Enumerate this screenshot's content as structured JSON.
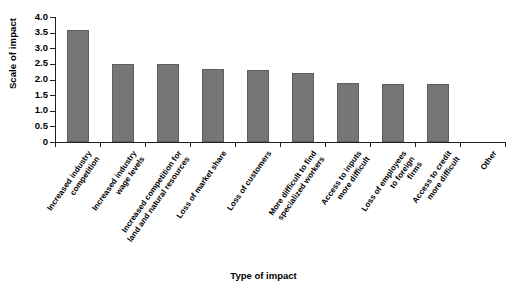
{
  "chart_data": {
    "type": "bar",
    "title": "",
    "xlabel": "Type of impact",
    "ylabel": "Scale of impact",
    "categories": [
      "Increased industry\ncompetition",
      "Increased industry\nwage levels",
      "Increased competition for\nland and natural resources",
      "Loss of market share",
      "Loss of customers",
      "More difficult to find\nspecialized workers",
      "Access to inputs\nmore difficult",
      "Loss of employees\nto foreign\nfirms",
      "Access to credit\nmore difficult",
      "Other"
    ],
    "values": [
      3.6,
      2.5,
      2.5,
      2.35,
      2.3,
      2.2,
      1.9,
      1.85,
      1.85,
      0
    ],
    "ylim": [
      0,
      4.0
    ],
    "yticks": [
      "0",
      "0.5",
      "1.0",
      "1.5",
      "2.0",
      "2.5",
      "3.0",
      "3.5",
      "4.0"
    ],
    "ytick_values": [
      0,
      0.5,
      1.0,
      1.5,
      2.0,
      2.5,
      3.0,
      3.5,
      4.0
    ],
    "grid": false,
    "legend": "none",
    "bar_color": "#767676",
    "axis_color": "#231f20"
  }
}
